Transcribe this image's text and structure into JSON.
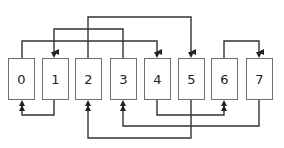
{
  "diagram": {
    "type": "permutation-network",
    "line_color": "#333333",
    "box_border_color": "#707070",
    "nodes": [
      {
        "label": "0",
        "x": 8
      },
      {
        "label": "1",
        "x": 42
      },
      {
        "label": "2",
        "x": 75
      },
      {
        "label": "3",
        "x": 110
      },
      {
        "label": "4",
        "x": 144
      },
      {
        "label": "5",
        "x": 178
      },
      {
        "label": "6",
        "x": 211
      },
      {
        "label": "7",
        "x": 246
      }
    ],
    "edges": [
      {
        "from": "2",
        "to": "5",
        "side": "top",
        "level": 17
      },
      {
        "from": "3",
        "to": "1",
        "side": "top",
        "level": 29
      },
      {
        "from": "0",
        "to": "4",
        "side": "top",
        "level": 41
      },
      {
        "from": "6",
        "to": "7",
        "side": "top",
        "level": 41
      },
      {
        "from": "1",
        "to": "0",
        "side": "bottom",
        "level": 115
      },
      {
        "from": "4",
        "to": "6",
        "side": "bottom",
        "level": 115
      },
      {
        "from": "7",
        "to": "3",
        "side": "bottom",
        "level": 126
      },
      {
        "from": "5",
        "to": "2",
        "side": "bottom",
        "level": 138
      }
    ]
  }
}
